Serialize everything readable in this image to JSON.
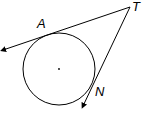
{
  "diagram": {
    "type": "geometry",
    "points": {
      "A": {
        "label": "A"
      },
      "T": {
        "label": "T"
      },
      "N": {
        "label": "N"
      }
    },
    "circle": {
      "center_marked": true
    },
    "colors": {
      "stroke": "#000000",
      "background": "#ffffff"
    }
  }
}
